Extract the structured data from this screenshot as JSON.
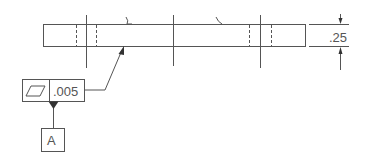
{
  "drawing": {
    "type": "GD&T flatness callout",
    "colors": {
      "line": "#555555",
      "background": "#ffffff"
    }
  },
  "part": {
    "thickness_dimension": ".25"
  },
  "feature_control_frame": {
    "symbol": "flatness-icon",
    "tolerance": ".005"
  },
  "datum": {
    "label": "A"
  }
}
